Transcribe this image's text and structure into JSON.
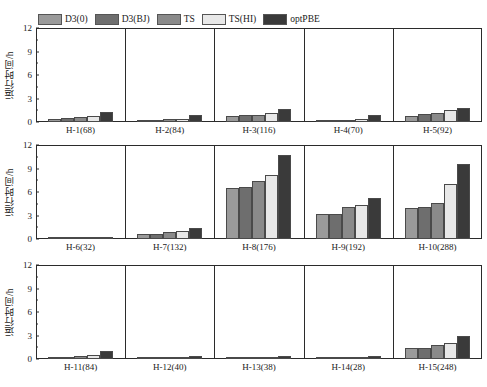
{
  "chart_data": {
    "type": "bar",
    "title": "",
    "xlabel": "",
    "ylabel": "运行时间/h",
    "ylim": [
      0,
      12
    ],
    "yticks": [
      0,
      3,
      6,
      9,
      12
    ],
    "grid": false,
    "legend_position": "top-left",
    "series_names": [
      "D3(0)",
      "D3(BJ)",
      "TS",
      "TS(HI)",
      "optPBE"
    ],
    "series_colors": [
      "#9a9a9a",
      "#6e6e6e",
      "#8a8a8a",
      "#e8e8e8",
      "#3a3a3a"
    ],
    "panel_layout": {
      "rows": 3,
      "cols": 5
    },
    "categories": [
      "H-1(68)",
      "H-2(84)",
      "H-3(116)",
      "H-4(70)",
      "H-5(92)",
      "H-6(32)",
      "H-7(132)",
      "H-8(176)",
      "H-9(192)",
      "H-10(288)",
      "H-11(84)",
      "H-12(40)",
      "H-13(38)",
      "H-14(28)",
      "H-15(248)"
    ],
    "panels": [
      {
        "label": "H-1(68)",
        "values": [
          0.45,
          0.55,
          0.6,
          0.75,
          1.35
        ]
      },
      {
        "label": "H-2(84)",
        "values": [
          0.3,
          0.32,
          0.35,
          0.45,
          0.95
        ]
      },
      {
        "label": "H-3(116)",
        "values": [
          0.8,
          0.85,
          0.95,
          1.15,
          1.65
        ]
      },
      {
        "label": "H-4(70)",
        "values": [
          0.25,
          0.27,
          0.28,
          0.4,
          0.95
        ]
      },
      {
        "label": "H-5(92)",
        "values": [
          0.8,
          1.05,
          1.15,
          1.55,
          1.8
        ]
      },
      {
        "label": "H-6(32)",
        "values": [
          0.04,
          0.04,
          0.05,
          0.07,
          0.25
        ]
      },
      {
        "label": "H-7(132)",
        "values": [
          0.7,
          0.7,
          0.95,
          1.05,
          1.45
        ]
      },
      {
        "label": "H-8(176)",
        "values": [
          6.7,
          6.8,
          7.6,
          8.4,
          10.9
        ]
      },
      {
        "label": "H-9(192)",
        "values": [
          3.2,
          3.25,
          4.2,
          4.45,
          5.3
        ]
      },
      {
        "label": "H-10(288)",
        "values": [
          4.1,
          4.15,
          4.7,
          7.2,
          9.8
        ]
      },
      {
        "label": "H-11(84)",
        "values": [
          0.25,
          0.3,
          0.35,
          0.5,
          1.0
        ]
      },
      {
        "label": "H-12(40)",
        "values": [
          0.08,
          0.1,
          0.12,
          0.18,
          0.45
        ]
      },
      {
        "label": "H-13(38)",
        "values": [
          0.06,
          0.07,
          0.09,
          0.14,
          0.42
        ]
      },
      {
        "label": "H-14(28)",
        "values": [
          0.04,
          0.05,
          0.06,
          0.1,
          0.45
        ]
      },
      {
        "label": "H-15(248)",
        "values": [
          1.5,
          1.5,
          1.8,
          2.1,
          3.0
        ]
      }
    ]
  },
  "legend": {
    "items": [
      {
        "label": "D3(0)",
        "color": "#9a9a9a"
      },
      {
        "label": "D3(BJ)",
        "color": "#6e6e6e"
      },
      {
        "label": "TS",
        "color": "#8a8a8a"
      },
      {
        "label": "TS(HI)",
        "color": "#e8e8e8"
      },
      {
        "label": "optPBE",
        "color": "#3a3a3a"
      }
    ]
  },
  "axes": {
    "y_title": "运行时间/h",
    "y_tick_labels": [
      "0",
      "3",
      "6",
      "9",
      "12"
    ]
  }
}
